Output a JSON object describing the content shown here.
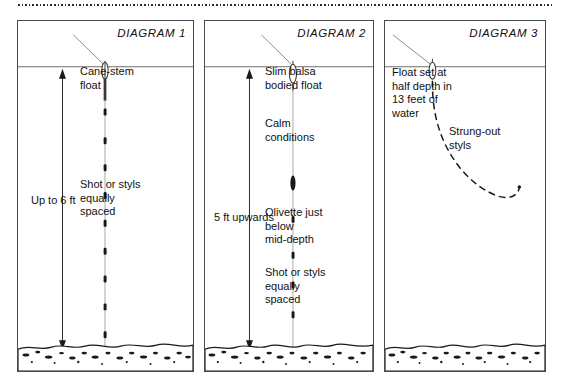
{
  "page": {
    "top_rule": "dotted-rule"
  },
  "diagrams": [
    {
      "id": "diagram-1",
      "title": "DIAGRAM 1",
      "float_name": "cane-stem-float",
      "annotations": {
        "float_label": "Cane-stem\nfloat",
        "depth_label": "Up to 6 ft",
        "shot_label": "Shot or styls\nequally\nspaced"
      },
      "shot_count": 9,
      "has_olivette": false,
      "waterline": true,
      "riverbed": true,
      "depth_arrow": "double-ended-vertical"
    },
    {
      "id": "diagram-2",
      "title": "DIAGRAM 2",
      "float_name": "slim-balsa-bodied-float",
      "annotations": {
        "float_label": "Slim balsa\nbodied float",
        "calm_label": "Calm\nconditions",
        "olivette_label": "Olivette just\nbelow\nmid-depth",
        "shot_label": "Shot or styls\nequally\nspaced",
        "depth_label": "5 ft upwards"
      },
      "shot_count": 5,
      "has_olivette": true,
      "waterline": true,
      "riverbed": true,
      "depth_arrow": "double-ended-vertical"
    },
    {
      "id": "diagram-3",
      "title": "DIAGRAM 3",
      "float_name": "float-at-half-depth",
      "annotations": {
        "float_label": "Float set at\nhalf depth in\n13 feet of\nwater",
        "styls_label": "Strung-out\nstyls"
      },
      "shot_count": 0,
      "has_olivette": false,
      "waterline": true,
      "riverbed": true,
      "depth_arrow": "none",
      "line_style": "strung-out-curve"
    }
  ],
  "colors": {
    "ink": "#111111",
    "frame": "#4a4a4a",
    "line": "#8c8c8c",
    "paper": "#ffffff"
  }
}
